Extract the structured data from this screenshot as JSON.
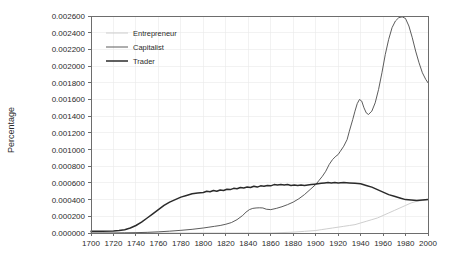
{
  "chart_data": {
    "type": "line",
    "title": "",
    "xlabel": "",
    "ylabel": "Percentage",
    "xlim": [
      1700,
      2000
    ],
    "ylim": [
      0.0,
      0.0026
    ],
    "grid": true,
    "legend_position": "top-left",
    "x_ticks": [
      1700,
      1720,
      1740,
      1760,
      1780,
      1800,
      1820,
      1840,
      1860,
      1880,
      1900,
      1920,
      1940,
      1960,
      1980,
      2000
    ],
    "x_tick_labels": [
      "1700",
      "1720",
      "1740",
      "1760",
      "1780",
      "1800",
      "1820",
      "1840",
      "1860",
      "1880",
      "1900",
      "1920",
      "1940",
      "1960",
      "1980",
      "2000"
    ],
    "y_ticks": [
      0.0,
      0.0002,
      0.0004,
      0.0006,
      0.0008,
      0.001,
      0.0012,
      0.0014,
      0.0016,
      0.0018,
      0.002,
      0.0022,
      0.0024,
      0.0026
    ],
    "y_tick_labels": [
      "0.000000",
      "0.000200",
      "0.000400",
      "0.000600",
      "0.000800",
      "0.001000",
      "0.001200",
      "0.001400",
      "0.001600",
      "0.001800",
      "0.002000",
      "0.002200",
      "0.002400",
      "0.002600"
    ],
    "series": [
      {
        "name": "Entrepreneur",
        "color": "#c8c8c8",
        "width": 0.9,
        "x": [
          1700,
          1720,
          1740,
          1760,
          1780,
          1800,
          1820,
          1840,
          1860,
          1870,
          1880,
          1890,
          1900,
          1905,
          1910,
          1915,
          1920,
          1925,
          1930,
          1935,
          1940,
          1945,
          1950,
          1955,
          1960,
          1965,
          1970,
          1975,
          1980,
          1985,
          1990,
          1995,
          2000
        ],
        "values": [
          0.0,
          0.0,
          0.0,
          0.0,
          0.0,
          0.0,
          0.0,
          0.0,
          0.0,
          5e-06,
          1e-05,
          2e-05,
          3e-05,
          4e-05,
          5e-05,
          6e-05,
          7e-05,
          8e-05,
          9e-05,
          0.0001,
          0.00012,
          0.00014,
          0.00016,
          0.00018,
          0.00021,
          0.00024,
          0.00027,
          0.0003,
          0.00033,
          0.00036,
          0.00038,
          0.00039,
          0.0004
        ]
      },
      {
        "name": "Capitalist",
        "color": "#4a4a4a",
        "width": 0.9,
        "x": [
          1700,
          1710,
          1720,
          1730,
          1740,
          1750,
          1760,
          1770,
          1780,
          1790,
          1800,
          1805,
          1810,
          1815,
          1820,
          1825,
          1830,
          1835,
          1838,
          1841,
          1844,
          1847,
          1850,
          1853,
          1856,
          1860,
          1865,
          1870,
          1875,
          1880,
          1885,
          1890,
          1895,
          1900,
          1903,
          1906,
          1909,
          1912,
          1915,
          1918,
          1920,
          1922,
          1925,
          1928,
          1930,
          1933,
          1935,
          1937,
          1939,
          1941,
          1943,
          1945,
          1947,
          1950,
          1953,
          1956,
          1959,
          1962,
          1965,
          1968,
          1971,
          1974,
          1977,
          1980,
          1983,
          1986,
          1989,
          1992,
          1995,
          1998,
          2000
        ],
        "values": [
          0.0,
          0.0,
          0.0,
          2e-06,
          4e-06,
          8e-06,
          1.4e-05,
          2.2e-05,
          3.2e-05,
          4.4e-05,
          6e-05,
          7e-05,
          8e-05,
          9e-05,
          0.000105,
          0.000125,
          0.00016,
          0.00021,
          0.00025,
          0.00028,
          0.000295,
          0.0003,
          0.000302,
          0.0003,
          0.000285,
          0.00028,
          0.000295,
          0.000315,
          0.00034,
          0.00037,
          0.00041,
          0.00046,
          0.00052,
          0.00058,
          0.00063,
          0.00068,
          0.00074,
          0.00082,
          0.00088,
          0.00092,
          0.00094,
          0.00098,
          0.00104,
          0.00112,
          0.00122,
          0.00136,
          0.00146,
          0.00155,
          0.0016,
          0.00158,
          0.0015,
          0.00144,
          0.00142,
          0.00146,
          0.00156,
          0.00172,
          0.00192,
          0.00214,
          0.00232,
          0.00246,
          0.00254,
          0.00258,
          0.00259,
          0.00257,
          0.00248,
          0.00234,
          0.00218,
          0.00204,
          0.00192,
          0.00184,
          0.0018
        ]
      },
      {
        "name": "Trader",
        "color": "#2b2b2b",
        "width": 1.5,
        "x": [
          1700,
          1710,
          1720,
          1725,
          1730,
          1735,
          1740,
          1745,
          1750,
          1755,
          1760,
          1765,
          1770,
          1775,
          1780,
          1785,
          1790,
          1795,
          1800,
          1803,
          1806,
          1809,
          1812,
          1815,
          1818,
          1821,
          1824,
          1827,
          1830,
          1833,
          1836,
          1839,
          1842,
          1845,
          1848,
          1851,
          1854,
          1857,
          1860,
          1863,
          1866,
          1869,
          1872,
          1875,
          1878,
          1881,
          1884,
          1887,
          1890,
          1893,
          1896,
          1899,
          1902,
          1905,
          1908,
          1911,
          1914,
          1917,
          1920,
          1925,
          1930,
          1935,
          1940,
          1945,
          1950,
          1955,
          1960,
          1965,
          1970,
          1975,
          1980,
          1985,
          1990,
          1995,
          2000
        ],
        "values": [
          2e-05,
          2e-05,
          2.5e-05,
          3e-05,
          4e-05,
          6e-05,
          9e-05,
          0.00013,
          0.00018,
          0.00023,
          0.00028,
          0.00033,
          0.00037,
          0.0004,
          0.00043,
          0.00045,
          0.00047,
          0.00048,
          0.000485,
          0.0005,
          0.000495,
          0.00051,
          0.0005,
          0.000515,
          0.00051,
          0.000525,
          0.00052,
          0.000535,
          0.00053,
          0.000545,
          0.00054,
          0.00055,
          0.000545,
          0.00056,
          0.00055,
          0.000565,
          0.00056,
          0.00057,
          0.000565,
          0.00058,
          0.000575,
          0.00058,
          0.000575,
          0.00058,
          0.00057,
          0.000575,
          0.00057,
          0.000575,
          0.00057,
          0.000575,
          0.00058,
          0.000585,
          0.00059,
          0.000595,
          0.0006,
          0.000605,
          0.0006,
          0.000605,
          0.0006,
          0.000605,
          0.0006,
          0.000595,
          0.00059,
          0.00057,
          0.00055,
          0.00052,
          0.00049,
          0.00046,
          0.00044,
          0.00042,
          0.0004,
          0.000395,
          0.00039,
          0.000395,
          0.0004
        ]
      }
    ]
  }
}
